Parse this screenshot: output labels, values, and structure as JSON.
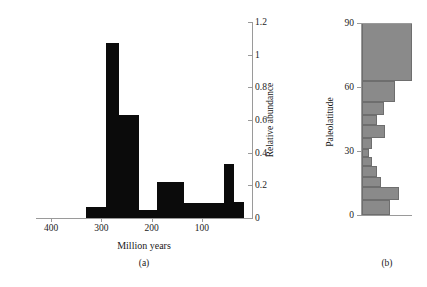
{
  "figure": {
    "background_color": "#ffffff",
    "panel_a_bar_color": "#0b0b0b",
    "panel_b_bar_color": "#8a8a8a",
    "axis_color": "#9a9a9a"
  },
  "panel_a": {
    "caption": "(a)",
    "x_axis_title": "Million years",
    "y_axis_title": "Relative abundance",
    "x_ticks": [
      "400",
      "300",
      "200",
      "100"
    ],
    "y_ticks": [
      "0",
      "0.2",
      "0.4",
      "0.6",
      "0.8",
      "1",
      "1.2"
    ]
  },
  "panel_b": {
    "caption": "(b)",
    "y_axis_title": "Paleolatitude",
    "y_ticks": [
      "0",
      "30",
      "60",
      "90"
    ]
  },
  "chart_data": [
    {
      "type": "bar",
      "panel": "a",
      "title": "",
      "xlabel": "Million years",
      "ylabel": "Relative abundance",
      "xlim": [
        430,
        0
      ],
      "ylim": [
        0,
        1.2
      ],
      "x_inverted": true,
      "grid": false,
      "legend": "none",
      "xtick_values": [
        400,
        300,
        200,
        100
      ],
      "ytick_values": [
        0,
        0.2,
        0.4,
        0.6,
        0.8,
        1,
        1.2
      ],
      "bin_edges": [
        330,
        290,
        265,
        225,
        190,
        155,
        135,
        55,
        35,
        15
      ],
      "categories": [
        "330-290",
        "290-265",
        "265-225",
        "225-190",
        "190-155",
        "155-135",
        "135-55",
        "55-35",
        "35-15"
      ],
      "values": [
        0.07,
        1.07,
        0.63,
        0.05,
        0.22,
        0.22,
        0.09,
        0.33,
        0.1
      ]
    },
    {
      "type": "bar",
      "panel": "b",
      "orientation": "horizontal",
      "title": "",
      "xlabel": "",
      "ylabel": "Paleolatitude",
      "ylim": [
        0,
        90
      ],
      "xlim": [
        0,
        1
      ],
      "grid": false,
      "legend": "none",
      "ytick_values": [
        0,
        30,
        60,
        90
      ],
      "bin_edges": [
        0,
        7,
        13,
        18,
        23,
        27,
        31,
        36,
        42,
        47,
        53,
        63,
        90
      ],
      "categories": [
        "0-7",
        "7-13",
        "13-18",
        "18-23",
        "23-27",
        "27-31",
        "31-36",
        "36-42",
        "42-47",
        "47-53",
        "53-63",
        "63-90"
      ],
      "values": [
        0.56,
        0.74,
        0.38,
        0.3,
        0.2,
        0.14,
        0.2,
        0.46,
        0.3,
        0.44,
        0.66,
        1.0
      ]
    }
  ]
}
